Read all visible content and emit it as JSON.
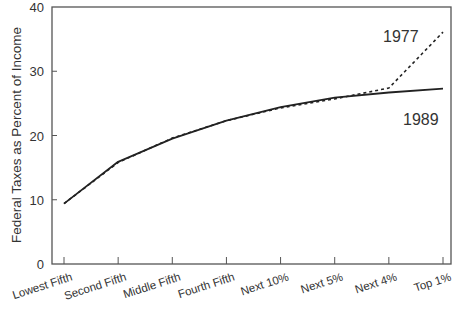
{
  "chart_data": {
    "type": "line",
    "title": "",
    "xlabel": "",
    "ylabel": "Federal Taxes as Percent of Income",
    "categories": [
      "Lowest Fifth",
      "Second Fifth",
      "Middle Fifth",
      "Fourth Fifth",
      "Next 10%",
      "Next 5%",
      "Next 4%",
      "Top 1%"
    ],
    "series": [
      {
        "name": "1977",
        "style": "dashed",
        "values": [
          9.4,
          15.8,
          19.6,
          22.3,
          24.3,
          25.7,
          27.4,
          36.1
        ]
      },
      {
        "name": "1989",
        "style": "solid",
        "values": [
          9.4,
          15.9,
          19.5,
          22.3,
          24.4,
          25.9,
          26.7,
          27.3
        ]
      }
    ],
    "ylim": [
      0,
      40
    ],
    "yticks": [
      0,
      10,
      20,
      30,
      40
    ],
    "grid": false,
    "legend": "inline labels near line ends",
    "annotations": [
      {
        "text": "1977",
        "near": "Top 1% dashed line"
      },
      {
        "text": "1989",
        "near": "Top 1% solid line"
      }
    ]
  },
  "colors": {
    "axis": "#555555",
    "line": "#222222",
    "text": "#333333"
  }
}
